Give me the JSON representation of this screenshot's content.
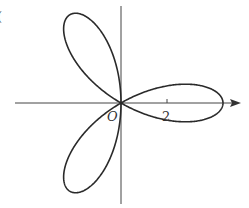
{
  "figure": {
    "type": "polar-rose-curve",
    "curve": "three-petal rose",
    "petal_count": 3,
    "petal_directions_deg": [
      0,
      120,
      240
    ],
    "origin_label": "O",
    "x_tick_label": "2",
    "axis": {
      "x_arrow": true,
      "y_arrow": false
    },
    "colors": {
      "curve": "#2a2a2a",
      "axis": "#444444",
      "background": "#ffffff"
    },
    "corner_mark": "("
  }
}
